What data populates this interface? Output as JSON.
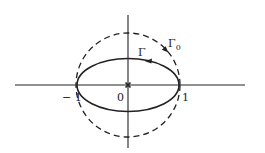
{
  "diagram": {
    "type": "complex-plane-contours",
    "colors": {
      "stroke": "#222222",
      "background": "#ffffff"
    },
    "axes": {
      "real_axis": {
        "x1": 15,
        "x2": 245,
        "y": 85
      },
      "imag_axis": {
        "x": 128,
        "y1": 15,
        "y2": 148
      }
    },
    "origin_marker": {
      "symbol": "x",
      "cx": 128,
      "cy": 85
    },
    "contours": [
      {
        "name": "Gamma",
        "label": "Γ",
        "style": "solid",
        "shape": "ellipse",
        "cx": 128,
        "cy": 85,
        "rx": 51,
        "ry": 26.5,
        "orientation": "counterclockwise"
      },
      {
        "name": "Gamma_0",
        "label": "Γ",
        "subscript": "0",
        "style": "dashed",
        "shape": "circle",
        "cx": 128,
        "cy": 85,
        "r": 52,
        "orientation": "clockwise"
      }
    ],
    "tick_labels": [
      {
        "text": "− 1",
        "x": 62,
        "y": 101
      },
      {
        "text": "0",
        "x": 117,
        "y": 101
      },
      {
        "text": "1",
        "x": 182,
        "y": 101
      }
    ],
    "contour_labels": {
      "gamma": {
        "text": "Γ",
        "x": 138,
        "y": 56
      },
      "gamma0": {
        "text": "Γ",
        "sub": "0",
        "x": 168,
        "y": 47
      }
    }
  }
}
